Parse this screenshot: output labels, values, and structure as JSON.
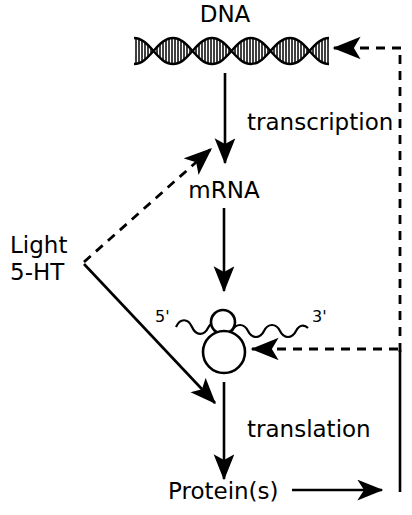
{
  "diagram": {
    "title_node": "DNA",
    "nodes": {
      "dna": "DNA",
      "mrna": "mRNA",
      "protein": "Protein(s)"
    },
    "processes": {
      "transcription": "transcription",
      "translation": "translation"
    },
    "stimuli": {
      "line1": "Light",
      "line2": "5-HT"
    },
    "rna_ends": {
      "five_prime": "5'",
      "three_prime": "3'"
    },
    "colors": {
      "ink": "#000000",
      "background": "#ffffff"
    }
  }
}
